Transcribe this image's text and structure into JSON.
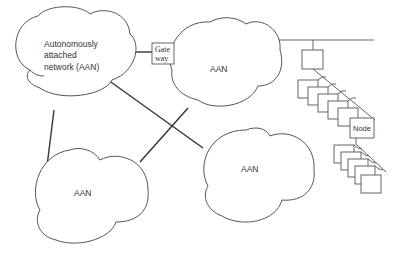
{
  "diagram": {
    "type": "network-topology",
    "networks": [
      {
        "id": "aan-1",
        "label_lines": [
          "Autonomously",
          "attached",
          "network (AAN)"
        ]
      },
      {
        "id": "aan-2",
        "label": "AAN"
      },
      {
        "id": "aan-3",
        "label": "AAN"
      },
      {
        "id": "aan-4",
        "label": "AAN"
      }
    ],
    "gateway": {
      "label_lines": [
        "Gate",
        "way"
      ]
    },
    "node": {
      "label": "Node"
    },
    "links": [
      {
        "from": "aan-1",
        "to": "gateway"
      },
      {
        "from": "gateway",
        "to": "aan-2"
      },
      {
        "from": "aan-1",
        "to": "aan-3"
      },
      {
        "from": "aan-1",
        "to": "aan-4"
      },
      {
        "from": "aan-2",
        "to": "aan-3"
      },
      {
        "from": "aan-2",
        "to": "bus"
      }
    ]
  }
}
